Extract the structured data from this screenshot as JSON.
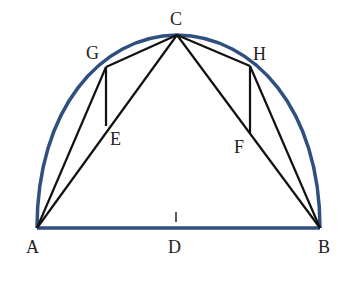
{
  "diagram": {
    "type": "geometry",
    "colors": {
      "arc": "#2f4f80",
      "lines": "#111111",
      "labels": "#222222",
      "background": "#ffffff"
    },
    "points": {
      "A": {
        "label": "A",
        "x": 37,
        "y": 228
      },
      "B": {
        "label": "B",
        "x": 320,
        "y": 228
      },
      "C": {
        "label": "C",
        "x": 177,
        "y": 35
      },
      "D": {
        "label": "D",
        "x": 176,
        "y": 228
      },
      "E": {
        "label": "E",
        "x": 106,
        "y": 126
      },
      "F": {
        "label": "F",
        "x": 250,
        "y": 133
      },
      "G": {
        "label": "G",
        "x": 106,
        "y": 67
      },
      "H": {
        "label": "H",
        "x": 250,
        "y": 66
      }
    },
    "segments": [
      [
        "A",
        "B"
      ],
      [
        "A",
        "C"
      ],
      [
        "C",
        "B"
      ],
      [
        "A",
        "G"
      ],
      [
        "G",
        "C"
      ],
      [
        "C",
        "H"
      ],
      [
        "H",
        "B"
      ],
      [
        "G",
        "E"
      ],
      [
        "H",
        "F"
      ]
    ],
    "arc": "semicircle over AB through C",
    "labels": {
      "A": "A",
      "B": "B",
      "C": "C",
      "D": "D",
      "E": "E",
      "F": "F",
      "G": "G",
      "H": "H"
    }
  }
}
